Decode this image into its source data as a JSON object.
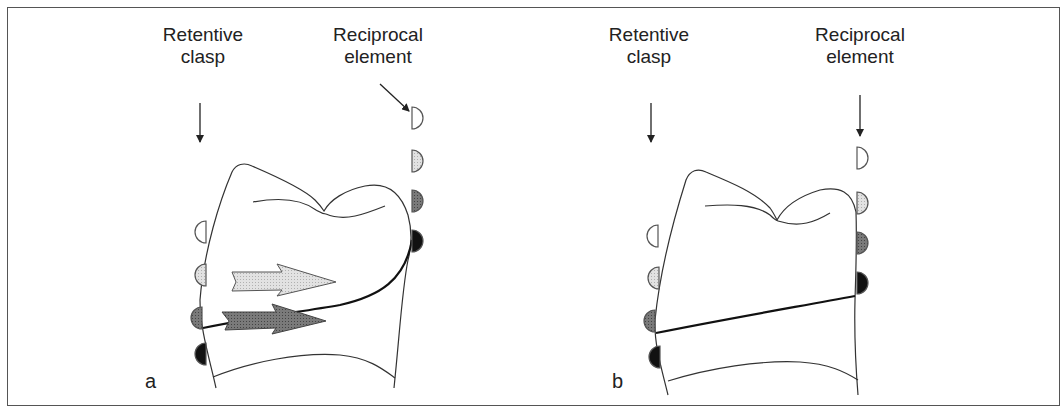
{
  "figure": {
    "panels": [
      {
        "id": "a",
        "letter": "a",
        "label_left": {
          "line1": "Retentive",
          "line2": "clasp"
        },
        "label_right": {
          "line1": "Reciprocal",
          "line2": "element"
        },
        "description": "Reciprocal element contacts tooth before retentive clasp passes height of contour; force arrows shown"
      },
      {
        "id": "b",
        "letter": "b",
        "label_left": {
          "line1": "Retentive",
          "line2": "clasp"
        },
        "label_right": {
          "line1": "Reciprocal",
          "line2": "element"
        },
        "description": "Reciprocal element and retentive clasp reach survey line simultaneously"
      }
    ],
    "colors": {
      "stage1": "#ffffff",
      "stage2": "#d9d9d9",
      "stage3": "#808080",
      "stage4": "#111111",
      "outline": "#333333",
      "arrow_light": "#d4d4d4",
      "arrow_dark": "#6e6e6e"
    }
  }
}
